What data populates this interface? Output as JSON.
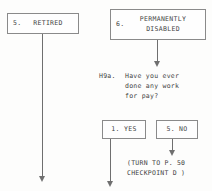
{
  "diagram": {
    "line_color": "#6f6f6f",
    "box_border_color": "#8a8a8a",
    "background": "#fdfdfc",
    "boxes": [
      {
        "id": "retired",
        "number": "5.",
        "label": "RETIRED"
      },
      {
        "id": "disabled",
        "number": "6.",
        "label": "PERMANENTLY\nDISABLED"
      },
      {
        "id": "yes",
        "number": "",
        "label": "1. YES"
      },
      {
        "id": "no",
        "number": "",
        "label": "5. NO"
      }
    ],
    "question": {
      "id": "H9a.",
      "line1": "Have you ever",
      "line2": "done any work",
      "line3": "for pay?"
    },
    "instruction": {
      "line1": "(TURN TO P. 50",
      "line2": "CHECKPOINT D )"
    }
  }
}
